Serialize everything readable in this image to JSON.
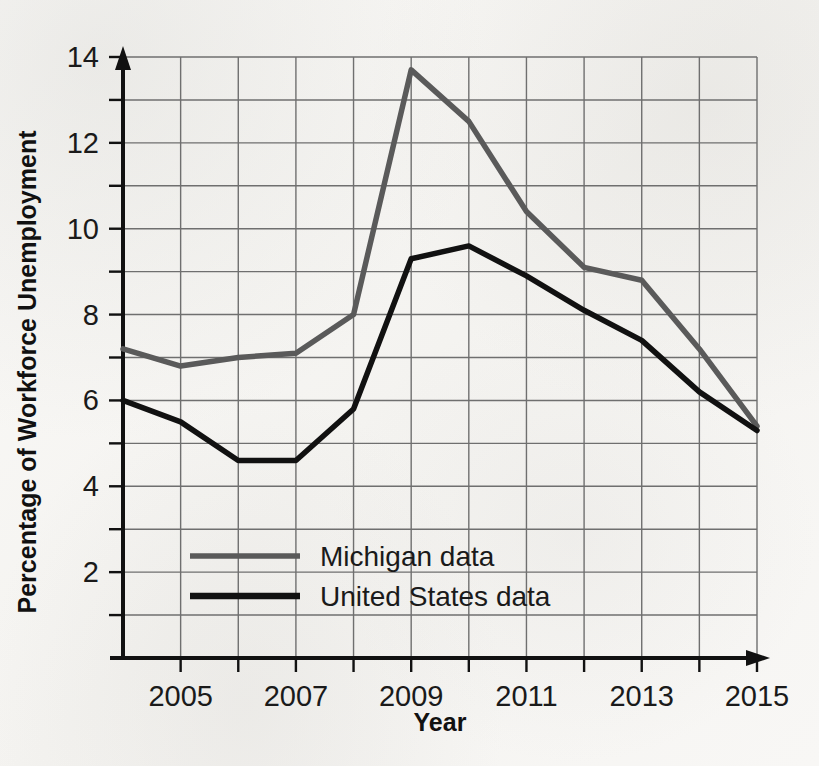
{
  "chart_data": {
    "type": "line",
    "title": "",
    "xlabel": "Year",
    "ylabel": "Percentage of Workforce Unemployment",
    "xlim": [
      2004,
      2015
    ],
    "ylim": [
      0,
      14
    ],
    "x": [
      2004,
      2005,
      2006,
      2007,
      2008,
      2009,
      2010,
      2011,
      2012,
      2013,
      2014,
      2015
    ],
    "x_tick_labels": [
      "2005",
      "2007",
      "2009",
      "2011",
      "2013",
      "2015"
    ],
    "x_tick_values": [
      2005,
      2007,
      2009,
      2011,
      2013,
      2015
    ],
    "y_tick_labels": [
      "2",
      "4",
      "6",
      "8",
      "10",
      "12",
      "14"
    ],
    "y_tick_values": [
      2,
      4,
      6,
      8,
      10,
      12,
      14
    ],
    "grid": true,
    "grid_y_values": [
      1,
      2,
      3,
      4,
      5,
      6,
      7,
      8,
      9,
      10,
      11,
      12,
      13,
      14
    ],
    "grid_x_values": [
      2005,
      2006,
      2007,
      2008,
      2009,
      2010,
      2011,
      2012,
      2013,
      2014,
      2015
    ],
    "legend_position": "inside-lower-left",
    "series": [
      {
        "name": "Michigan data",
        "color": "#5a5a5a",
        "values": [
          7.2,
          6.8,
          7.0,
          7.1,
          8.0,
          13.7,
          12.5,
          10.4,
          9.1,
          8.8,
          7.2,
          5.4
        ]
      },
      {
        "name": "United States data",
        "color": "#111111",
        "values": [
          6.0,
          5.5,
          4.6,
          4.6,
          5.8,
          9.3,
          9.6,
          8.9,
          8.1,
          7.4,
          6.2,
          5.3
        ]
      }
    ]
  },
  "legend": {
    "items": [
      {
        "label": "Michigan data",
        "color": "#5a5a5a"
      },
      {
        "label": "United States data",
        "color": "#111111"
      }
    ]
  },
  "axes": {
    "x_title": "Year",
    "y_title": "Percentage of Workforce Unemployment"
  }
}
